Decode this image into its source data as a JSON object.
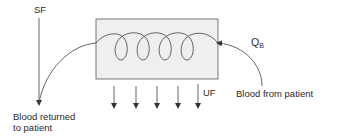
{
  "diagram": {
    "labels": {
      "sf": "SF",
      "uf": "UF",
      "qb_main": "Q",
      "qb_sub": "B",
      "blood_from": "Blood from patient",
      "blood_returned_line1": "Blood returned",
      "blood_returned_line2": "to patient"
    },
    "elements": {
      "filter_box": {
        "fill": "#efefef",
        "stroke": "#6a6a6a"
      },
      "coil_loops": 4,
      "uf_arrows": 5
    },
    "colors": {
      "line": "#555555",
      "text": "#2a2a2a",
      "box_fill": "#efefef"
    }
  }
}
